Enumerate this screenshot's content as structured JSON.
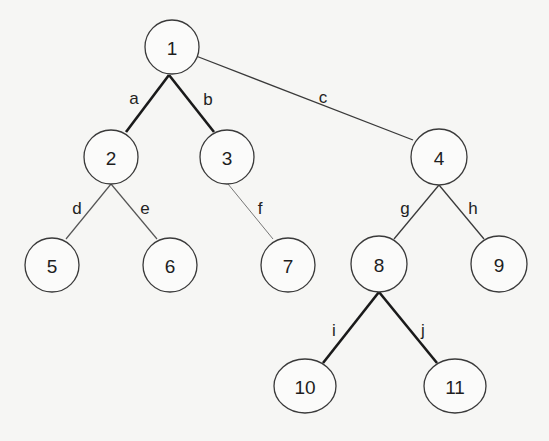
{
  "diagram": {
    "type": "tree",
    "nodes": [
      {
        "id": "1",
        "label": "1",
        "x": 172,
        "y": 47,
        "rx": 27,
        "ry": 27
      },
      {
        "id": "2",
        "label": "2",
        "x": 111,
        "y": 157,
        "rx": 27,
        "ry": 27
      },
      {
        "id": "3",
        "label": "3",
        "x": 227,
        "y": 157,
        "rx": 27,
        "ry": 27
      },
      {
        "id": "4",
        "label": "4",
        "x": 439,
        "y": 157,
        "rx": 28,
        "ry": 28
      },
      {
        "id": "5",
        "label": "5",
        "x": 52,
        "y": 265,
        "rx": 27,
        "ry": 27
      },
      {
        "id": "6",
        "label": "6",
        "x": 170,
        "y": 265,
        "rx": 27,
        "ry": 27
      },
      {
        "id": "7",
        "label": "7",
        "x": 288,
        "y": 265,
        "rx": 27,
        "ry": 27
      },
      {
        "id": "8",
        "label": "8",
        "x": 379,
        "y": 264,
        "rx": 28,
        "ry": 28
      },
      {
        "id": "9",
        "label": "9",
        "x": 499,
        "y": 264,
        "rx": 28,
        "ry": 28
      },
      {
        "id": "10",
        "label": "10",
        "x": 305,
        "y": 386,
        "rx": 31,
        "ry": 27
      },
      {
        "id": "11",
        "label": "11",
        "x": 455,
        "y": 386,
        "rx": 31,
        "ry": 27
      }
    ],
    "edges": [
      {
        "label": "a",
        "from": "1",
        "to": "2",
        "x1": 169,
        "y1": 75,
        "x2": 126,
        "y2": 132,
        "lx": 134,
        "ly": 98,
        "width": 2.6,
        "color": "#1a1a1a"
      },
      {
        "label": "b",
        "from": "1",
        "to": "3",
        "x1": 169,
        "y1": 75,
        "x2": 214,
        "y2": 132,
        "lx": 208,
        "ly": 99,
        "width": 2.6,
        "color": "#1a1a1a"
      },
      {
        "label": "c",
        "from": "1",
        "to": "4",
        "x1": 196,
        "y1": 56,
        "x2": 413,
        "y2": 140,
        "lx": 323,
        "ly": 97,
        "width": 1.3,
        "color": "#3a3a3a"
      },
      {
        "label": "d",
        "from": "2",
        "to": "5",
        "x1": 111,
        "y1": 184,
        "x2": 66,
        "y2": 239,
        "lx": 77,
        "ly": 208,
        "width": 1.2,
        "color": "#555555"
      },
      {
        "label": "e",
        "from": "2",
        "to": "6",
        "x1": 111,
        "y1": 184,
        "x2": 157,
        "y2": 239,
        "lx": 145,
        "ly": 208,
        "width": 1.2,
        "color": "#555555"
      },
      {
        "label": "f",
        "from": "3",
        "to": "7",
        "x1": 228,
        "y1": 184,
        "x2": 273,
        "y2": 239,
        "lx": 260,
        "ly": 208,
        "width": 1.0,
        "color": "#777777"
      },
      {
        "label": "g",
        "from": "4",
        "to": "8",
        "x1": 439,
        "y1": 185,
        "x2": 394,
        "y2": 239,
        "lx": 405,
        "ly": 208,
        "width": 1.3,
        "color": "#3a3a3a"
      },
      {
        "label": "h",
        "from": "4",
        "to": "9",
        "x1": 439,
        "y1": 185,
        "x2": 484,
        "y2": 239,
        "lx": 473,
        "ly": 208,
        "width": 1.3,
        "color": "#3a3a3a"
      },
      {
        "label": "i",
        "from": "8",
        "to": "10",
        "x1": 379,
        "y1": 292,
        "x2": 323,
        "y2": 363,
        "lx": 334,
        "ly": 330,
        "width": 2.6,
        "color": "#1a1a1a"
      },
      {
        "label": "j",
        "from": "8",
        "to": "11",
        "x1": 379,
        "y1": 292,
        "x2": 437,
        "y2": 363,
        "lx": 423,
        "ly": 330,
        "width": 2.6,
        "color": "#1a1a1a"
      }
    ]
  }
}
